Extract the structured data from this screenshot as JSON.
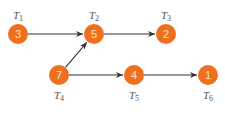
{
  "diagram": {
    "type": "task-precedence-graph",
    "colors": {
      "node_fill": "#ee6f1e",
      "node_text": "#fde3c8",
      "edge": "#333333",
      "label": "#555555",
      "background": "#ffffff"
    },
    "nodes": [
      {
        "id": "T1",
        "label": "T",
        "sub": "1",
        "value": "3",
        "x": 18,
        "y": 34,
        "label_pos": "above"
      },
      {
        "id": "T2",
        "label": "T",
        "sub": "2",
        "value": "5",
        "x": 94,
        "y": 34,
        "label_pos": "above"
      },
      {
        "id": "T3",
        "label": "T",
        "sub": "3",
        "value": "2",
        "x": 166,
        "y": 34,
        "label_pos": "above"
      },
      {
        "id": "T4",
        "label": "T",
        "sub": "4",
        "value": "7",
        "x": 59,
        "y": 75,
        "label_pos": "below"
      },
      {
        "id": "T5",
        "label": "T",
        "sub": "5",
        "value": "4",
        "x": 134,
        "y": 75,
        "label_pos": "below"
      },
      {
        "id": "T6",
        "label": "T",
        "sub": "6",
        "value": "1",
        "x": 208,
        "y": 75,
        "label_pos": "below"
      }
    ],
    "edges": [
      {
        "from": "T1",
        "to": "T2"
      },
      {
        "from": "T2",
        "to": "T3"
      },
      {
        "from": "T4",
        "to": "T2"
      },
      {
        "from": "T4",
        "to": "T5"
      },
      {
        "from": "T5",
        "to": "T6"
      }
    ]
  }
}
